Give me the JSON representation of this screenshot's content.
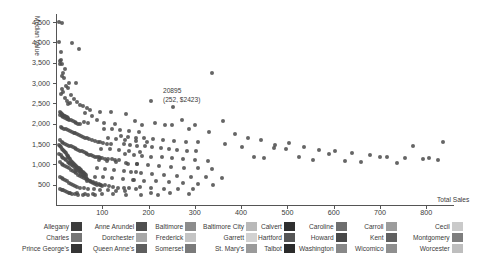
{
  "chart_data": {
    "type": "scatter",
    "title": "",
    "xlabel": "Total Sales",
    "ylabel": "Median Value",
    "xlim": [
      0,
      860
    ],
    "ylim": [
      0,
      4700
    ],
    "grid": false,
    "xticks": [
      100,
      200,
      300,
      400,
      500,
      600,
      700,
      800
    ],
    "xtick_labels": [
      "100",
      "200",
      "300",
      "400",
      "500",
      "600",
      "700",
      "800"
    ],
    "yticks": [
      500,
      1000,
      1500,
      2000,
      2500,
      3000,
      3500,
      4000,
      4500
    ],
    "ytick_labels": [
      "500",
      "1,000",
      "1,500",
      "2,000",
      "2,500",
      "3,000",
      "3,500",
      "4,000",
      "4,500"
    ],
    "annotation": {
      "id": "20895",
      "coords": "(252, $2423)",
      "x": 252,
      "y": 2423
    },
    "point_color": "#4a4a4a",
    "legend_position": "bottom",
    "legend_title": "",
    "series": [
      {
        "name": "Allegany",
        "color": "#3d3d3d"
      },
      {
        "name": "Anne Arundel",
        "color": "#4f4f4f"
      },
      {
        "name": "Baltimore",
        "color": "#8c8c8c"
      },
      {
        "name": "Baltimore City",
        "color": "#b9b9b9"
      },
      {
        "name": "Calvert",
        "color": "#2f2f2f"
      },
      {
        "name": "Caroline",
        "color": "#6e6e6e"
      },
      {
        "name": "Carroll",
        "color": "#9c9c9c"
      },
      {
        "name": "Cecil",
        "color": "#cacaca"
      },
      {
        "name": "Charles",
        "color": "#767676"
      },
      {
        "name": "Dorchester",
        "color": "#a8a8a8"
      },
      {
        "name": "Frederick",
        "color": "#c4c4c4"
      },
      {
        "name": "Garrett",
        "color": "#d2d2d2"
      },
      {
        "name": "Hartford",
        "color": "#565656"
      },
      {
        "name": "Howard",
        "color": "#484848"
      },
      {
        "name": "Kent",
        "color": "#606060"
      },
      {
        "name": "Montgomery",
        "color": "#7e7e7e"
      },
      {
        "name": "Prince George's",
        "color": "#353535"
      },
      {
        "name": "Queen Anne's",
        "color": "#5e5e5e"
      },
      {
        "name": "Somerset",
        "color": "#7a7a7a"
      },
      {
        "name": "St. Mary's",
        "color": "#9a9a9a"
      },
      {
        "name": "Talbot",
        "color": "#2b2b2b"
      },
      {
        "name": "Washington",
        "color": "#888888"
      },
      {
        "name": "Wicomico",
        "color": "#8f8f8f"
      },
      {
        "name": "Worcester",
        "color": "#bebebe"
      }
    ],
    "points": [
      [
        6,
        4500
      ],
      [
        14,
        4480
      ],
      [
        10,
        3560
      ],
      [
        8,
        3540
      ],
      [
        9,
        3480
      ],
      [
        34,
        3980
      ],
      [
        49,
        3830
      ],
      [
        338,
        3240
      ],
      [
        44,
        3010
      ],
      [
        28,
        2990
      ],
      [
        12,
        2860
      ],
      [
        16,
        2790
      ],
      [
        10,
        2720
      ],
      [
        20,
        2640
      ],
      [
        24,
        2560
      ],
      [
        30,
        2520
      ],
      [
        27,
        2480
      ],
      [
        205,
        2560
      ],
      [
        252,
        2423
      ],
      [
        58,
        2430
      ],
      [
        66,
        2380
      ],
      [
        74,
        2330
      ],
      [
        96,
        2300
      ],
      [
        118,
        2290
      ],
      [
        152,
        2250
      ],
      [
        8,
        2210
      ],
      [
        12,
        2180
      ],
      [
        16,
        2160
      ],
      [
        20,
        2140
      ],
      [
        24,
        2120
      ],
      [
        28,
        2100
      ],
      [
        32,
        2080
      ],
      [
        36,
        2060
      ],
      [
        40,
        2040
      ],
      [
        44,
        2020
      ],
      [
        48,
        2000
      ],
      [
        52,
        1990
      ],
      [
        60,
        2040
      ],
      [
        70,
        2020
      ],
      [
        88,
        2080
      ],
      [
        104,
        2010
      ],
      [
        128,
        1990
      ],
      [
        170,
        2070
      ],
      [
        186,
        1980
      ],
      [
        214,
        2030
      ],
      [
        236,
        1960
      ],
      [
        272,
        2090
      ],
      [
        300,
        1960
      ],
      [
        10,
        1920
      ],
      [
        14,
        1900
      ],
      [
        18,
        1880
      ],
      [
        22,
        1860
      ],
      [
        26,
        1840
      ],
      [
        30,
        1820
      ],
      [
        34,
        1800
      ],
      [
        38,
        1780
      ],
      [
        42,
        1760
      ],
      [
        46,
        1740
      ],
      [
        50,
        1720
      ],
      [
        54,
        1700
      ],
      [
        58,
        1680
      ],
      [
        62,
        1660
      ],
      [
        66,
        1640
      ],
      [
        72,
        1620
      ],
      [
        78,
        1600
      ],
      [
        84,
        1580
      ],
      [
        90,
        1560
      ],
      [
        96,
        1540
      ],
      [
        102,
        1520
      ],
      [
        110,
        1500
      ],
      [
        118,
        1490
      ],
      [
        8,
        1600
      ],
      [
        12,
        1560
      ],
      [
        16,
        1520
      ],
      [
        20,
        1500
      ],
      [
        24,
        1480
      ],
      [
        28,
        1460
      ],
      [
        32,
        1440
      ],
      [
        36,
        1420
      ],
      [
        40,
        1400
      ],
      [
        44,
        1380
      ],
      [
        48,
        1360
      ],
      [
        52,
        1340
      ],
      [
        56,
        1320
      ],
      [
        60,
        1300
      ],
      [
        64,
        1280
      ],
      [
        68,
        1260
      ],
      [
        72,
        1240
      ],
      [
        76,
        1220
      ],
      [
        80,
        1200
      ],
      [
        84,
        1190
      ],
      [
        88,
        1180
      ],
      [
        92,
        1170
      ],
      [
        96,
        1160
      ],
      [
        100,
        1150
      ],
      [
        106,
        1140
      ],
      [
        112,
        1130
      ],
      [
        120,
        1120
      ],
      [
        128,
        1110
      ],
      [
        136,
        1100
      ],
      [
        6,
        1480
      ],
      [
        9,
        1450
      ],
      [
        11,
        1420
      ],
      [
        13,
        1390
      ],
      [
        15,
        1360
      ],
      [
        17,
        1330
      ],
      [
        19,
        1300
      ],
      [
        21,
        1270
      ],
      [
        23,
        1240
      ],
      [
        25,
        1210
      ],
      [
        27,
        1180
      ],
      [
        29,
        1150
      ],
      [
        31,
        1120
      ],
      [
        33,
        1090
      ],
      [
        35,
        1060
      ],
      [
        37,
        1030
      ],
      [
        39,
        1000
      ],
      [
        41,
        980
      ],
      [
        43,
        960
      ],
      [
        45,
        940
      ],
      [
        47,
        920
      ],
      [
        49,
        900
      ],
      [
        51,
        880
      ],
      [
        53,
        860
      ],
      [
        55,
        840
      ],
      [
        57,
        820
      ],
      [
        59,
        800
      ],
      [
        61,
        780
      ],
      [
        63,
        760
      ],
      [
        65,
        740
      ],
      [
        7,
        1250
      ],
      [
        10,
        1220
      ],
      [
        13,
        1190
      ],
      [
        16,
        1160
      ],
      [
        19,
        1130
      ],
      [
        22,
        1100
      ],
      [
        25,
        1070
      ],
      [
        28,
        1040
      ],
      [
        31,
        1010
      ],
      [
        34,
        980
      ],
      [
        37,
        950
      ],
      [
        40,
        920
      ],
      [
        43,
        890
      ],
      [
        46,
        860
      ],
      [
        49,
        830
      ],
      [
        52,
        800
      ],
      [
        55,
        770
      ],
      [
        58,
        740
      ],
      [
        61,
        710
      ],
      [
        64,
        680
      ],
      [
        67,
        650
      ],
      [
        70,
        620
      ],
      [
        73,
        590
      ],
      [
        76,
        560
      ],
      [
        80,
        540
      ],
      [
        84,
        520
      ],
      [
        88,
        500
      ],
      [
        94,
        480
      ],
      [
        100,
        460
      ],
      [
        8,
        1050
      ],
      [
        12,
        1020
      ],
      [
        16,
        990
      ],
      [
        20,
        960
      ],
      [
        24,
        930
      ],
      [
        28,
        900
      ],
      [
        32,
        870
      ],
      [
        36,
        840
      ],
      [
        40,
        810
      ],
      [
        44,
        780
      ],
      [
        48,
        750
      ],
      [
        52,
        720
      ],
      [
        56,
        690
      ],
      [
        60,
        660
      ],
      [
        64,
        630
      ],
      [
        68,
        600
      ],
      [
        74,
        580
      ],
      [
        80,
        560
      ],
      [
        86,
        540
      ],
      [
        92,
        520
      ],
      [
        98,
        500
      ],
      [
        106,
        480
      ],
      [
        114,
        460
      ],
      [
        124,
        440
      ],
      [
        134,
        430
      ],
      [
        146,
        420
      ],
      [
        158,
        410
      ],
      [
        172,
        400
      ],
      [
        8,
        700
      ],
      [
        12,
        670
      ],
      [
        16,
        640
      ],
      [
        20,
        610
      ],
      [
        24,
        580
      ],
      [
        28,
        550
      ],
      [
        32,
        520
      ],
      [
        36,
        490
      ],
      [
        40,
        460
      ],
      [
        46,
        440
      ],
      [
        52,
        420
      ],
      [
        60,
        410
      ],
      [
        70,
        395
      ],
      [
        82,
        385
      ],
      [
        96,
        375
      ],
      [
        112,
        365
      ],
      [
        130,
        355
      ],
      [
        150,
        345
      ],
      [
        146,
        1500
      ],
      [
        160,
        1480
      ],
      [
        176,
        1460
      ],
      [
        192,
        1440
      ],
      [
        208,
        1420
      ],
      [
        226,
        1400
      ],
      [
        244,
        1380
      ],
      [
        262,
        1360
      ],
      [
        282,
        1340
      ],
      [
        302,
        1320
      ],
      [
        140,
        1700
      ],
      [
        156,
        1680
      ],
      [
        172,
        1660
      ],
      [
        190,
        1640
      ],
      [
        210,
        1620
      ],
      [
        232,
        1600
      ],
      [
        256,
        1580
      ],
      [
        280,
        1560
      ],
      [
        306,
        1540
      ],
      [
        150,
        1250
      ],
      [
        168,
        1230
      ],
      [
        186,
        1210
      ],
      [
        206,
        1190
      ],
      [
        228,
        1170
      ],
      [
        250,
        1150
      ],
      [
        274,
        1130
      ],
      [
        300,
        1110
      ],
      [
        328,
        1090
      ],
      [
        156,
        1020
      ],
      [
        176,
        1000
      ],
      [
        198,
        980
      ],
      [
        222,
        960
      ],
      [
        248,
        940
      ],
      [
        276,
        920
      ],
      [
        306,
        900
      ],
      [
        338,
        880
      ],
      [
        162,
        800
      ],
      [
        184,
        780
      ],
      [
        208,
        760
      ],
      [
        234,
        740
      ],
      [
        262,
        720
      ],
      [
        292,
        700
      ],
      [
        324,
        680
      ],
      [
        358,
        660
      ],
      [
        166,
        620
      ],
      [
        190,
        600
      ],
      [
        216,
        580
      ],
      [
        244,
        560
      ],
      [
        274,
        540
      ],
      [
        306,
        520
      ],
      [
        340,
        500
      ],
      [
        250,
        1960
      ],
      [
        288,
        1870
      ],
      [
        330,
        1790
      ],
      [
        366,
        1500
      ],
      [
        402,
        1420
      ],
      [
        428,
        1180
      ],
      [
        450,
        1160
      ],
      [
        470,
        1400
      ],
      [
        496,
        1370
      ],
      [
        524,
        1190
      ],
      [
        556,
        1100
      ],
      [
        590,
        1260
      ],
      [
        624,
        1080
      ],
      [
        660,
        1060
      ],
      [
        700,
        1180
      ],
      [
        736,
        1030
      ],
      [
        772,
        1440
      ],
      [
        806,
        1150
      ],
      [
        836,
        1560
      ],
      [
        360,
        2060
      ],
      [
        386,
        1740
      ],
      [
        414,
        1660
      ],
      [
        442,
        1600
      ],
      [
        474,
        1480
      ],
      [
        504,
        1520
      ],
      [
        536,
        1430
      ],
      [
        568,
        1350
      ],
      [
        602,
        1320
      ],
      [
        640,
        1280
      ],
      [
        678,
        1220
      ],
      [
        716,
        1190
      ],
      [
        754,
        1160
      ],
      [
        792,
        1120
      ],
      [
        826,
        1100
      ],
      [
        182,
        440
      ],
      [
        206,
        420
      ],
      [
        234,
        405
      ],
      [
        264,
        395
      ],
      [
        296,
        385
      ],
      [
        206,
        300
      ],
      [
        246,
        290
      ],
      [
        288,
        280
      ],
      [
        30,
        300
      ],
      [
        46,
        290
      ],
      [
        62,
        280
      ],
      [
        80,
        270
      ],
      [
        100,
        265
      ],
      [
        124,
        260
      ],
      [
        152,
        255
      ],
      [
        184,
        250
      ],
      [
        220,
        245
      ],
      [
        8,
        400
      ],
      [
        12,
        380
      ],
      [
        16,
        360
      ],
      [
        20,
        340
      ],
      [
        24,
        320
      ],
      [
        28,
        300
      ],
      [
        34,
        280
      ],
      [
        40,
        265
      ],
      [
        48,
        255
      ],
      [
        58,
        248
      ],
      [
        70,
        242
      ],
      [
        84,
        238
      ],
      [
        9,
        2280
      ],
      [
        11,
        2260
      ],
      [
        13,
        2240
      ],
      [
        15,
        2220
      ],
      [
        17,
        2200
      ],
      [
        19,
        2185
      ],
      [
        21,
        2170
      ],
      [
        23,
        2155
      ],
      [
        25,
        2140
      ],
      [
        27,
        2125
      ],
      [
        104,
        1880
      ],
      [
        120,
        1860
      ],
      [
        138,
        1840
      ],
      [
        158,
        1820
      ],
      [
        180,
        1800
      ],
      [
        112,
        1640
      ],
      [
        130,
        1620
      ],
      [
        150,
        1600
      ],
      [
        172,
        1580
      ],
      [
        196,
        1560
      ],
      [
        98,
        1390
      ],
      [
        116,
        1370
      ],
      [
        136,
        1350
      ],
      [
        158,
        1330
      ],
      [
        182,
        1310
      ],
      [
        92,
        1100
      ],
      [
        110,
        1080
      ],
      [
        130,
        1060
      ],
      [
        152,
        1040
      ],
      [
        176,
        1020
      ],
      [
        88,
        900
      ],
      [
        106,
        880
      ],
      [
        126,
        860
      ],
      [
        148,
        840
      ],
      [
        172,
        820
      ],
      [
        84,
        700
      ],
      [
        102,
        680
      ],
      [
        122,
        660
      ],
      [
        144,
        640
      ],
      [
        168,
        620
      ],
      [
        12,
        3180
      ],
      [
        18,
        3120
      ],
      [
        22,
        2930
      ],
      [
        26,
        2880
      ],
      [
        33,
        2700
      ],
      [
        39,
        2620
      ],
      [
        45,
        2540
      ],
      [
        52,
        2470
      ],
      [
        62,
        2270
      ],
      [
        78,
        2190
      ],
      [
        7,
        4020
      ],
      [
        10,
        3760
      ],
      [
        13,
        3460
      ],
      [
        20,
        3340
      ],
      [
        15,
        3260
      ]
    ]
  },
  "legend_groups": [
    {
      "left": 22,
      "rows": [
        "Allegany",
        "Charles",
        "Prince George's"
      ]
    },
    {
      "left": 93,
      "rows": [
        "Anne Arundel",
        "Dorchester",
        "Queen Anne's"
      ]
    },
    {
      "left": 155,
      "rows": [
        "Baltimore",
        "Frederick",
        "Somerset"
      ]
    },
    {
      "left": 203,
      "rows": [
        "Baltimore City",
        "Garrett",
        "St. Mary's"
      ]
    },
    {
      "left": 258,
      "rows": [
        "Calvert",
        "Hartford",
        "Talbot"
      ]
    },
    {
      "left": 299,
      "rows": [
        "Caroline",
        "Howard",
        "Washington"
      ]
    },
    {
      "left": 355,
      "rows": [
        "Carroll",
        "Kent",
        "Wicomico"
      ]
    },
    {
      "left": 413,
      "rows": [
        "Cecil",
        "Montgomery",
        "Worcester"
      ]
    }
  ]
}
